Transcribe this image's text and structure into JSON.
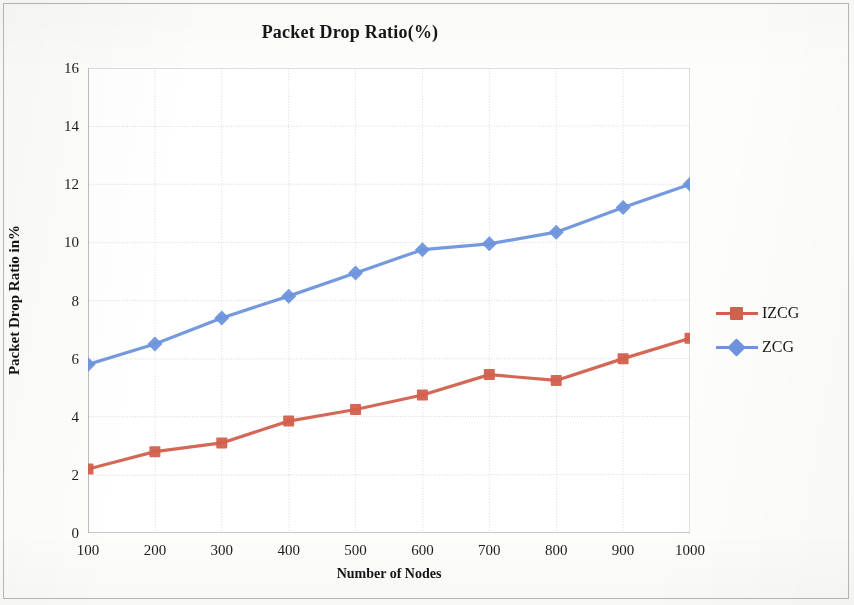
{
  "chart_data": {
    "type": "line",
    "title": "Packet Drop Ratio(%)",
    "xlabel": "Number of Nodes",
    "ylabel": "Packet Drop Ratio in%",
    "categories": [
      100,
      200,
      300,
      400,
      500,
      600,
      700,
      800,
      900,
      1000
    ],
    "x_tick_labels": [
      "100",
      "200",
      "300",
      "400",
      "500",
      "600",
      "700",
      "800",
      "900",
      "1000"
    ],
    "y_tick_labels": [
      "0",
      "2",
      "4",
      "6",
      "8",
      "10",
      "12",
      "14",
      "16"
    ],
    "y_ticks": [
      0,
      2,
      4,
      6,
      8,
      10,
      12,
      14,
      16
    ],
    "ylim": [
      0,
      16
    ],
    "xlim": [
      100,
      1000
    ],
    "grid": true,
    "legend_position": "right",
    "series": [
      {
        "name": "IZCG",
        "color": "#d2604d",
        "marker": "square",
        "values": [
          2.2,
          2.8,
          3.1,
          3.85,
          4.25,
          4.75,
          5.45,
          5.25,
          6.0,
          6.7
        ]
      },
      {
        "name": "ZCG",
        "color": "#6e93dc",
        "marker": "diamond",
        "values": [
          5.8,
          6.5,
          7.4,
          8.15,
          8.95,
          9.75,
          9.95,
          10.35,
          11.2,
          12.0
        ]
      }
    ]
  },
  "colors": {
    "izcg": "#d2604d",
    "zcg": "#6e93dc",
    "grid": "#c9c9c9",
    "axis": "#8d8d8d",
    "text": "#1a1a1a",
    "page_border": "#b9b9b9"
  }
}
